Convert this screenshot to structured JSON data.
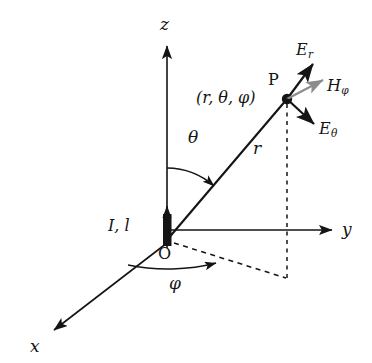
{
  "figure": {
    "background_color": "#ffffff",
    "line_color": "#141414",
    "accent_color": "#8c8c8c"
  },
  "axes": [
    {
      "name": "z",
      "label": "z"
    },
    {
      "name": "y",
      "label": "y"
    },
    {
      "name": "x",
      "label": "x"
    }
  ],
  "origin": {
    "label": "O"
  },
  "source": {
    "label_current": "I",
    "label_separator": ",",
    "label_length": "l",
    "label": "I, l"
  },
  "point": {
    "label": "P",
    "coordinates_label": "(r, θ, φ)",
    "radius_label": "r"
  },
  "angles": [
    {
      "name": "theta",
      "label": "θ"
    },
    {
      "name": "phi",
      "label": "φ"
    }
  ],
  "field_vectors": [
    {
      "name": "E_r",
      "base": "E",
      "sub": "r",
      "color": "#141414"
    },
    {
      "name": "H_phi",
      "base": "H",
      "sub": "φ",
      "color": "#8c8c8c"
    },
    {
      "name": "E_theta",
      "base": "E",
      "sub": "θ",
      "color": "#141414"
    }
  ]
}
